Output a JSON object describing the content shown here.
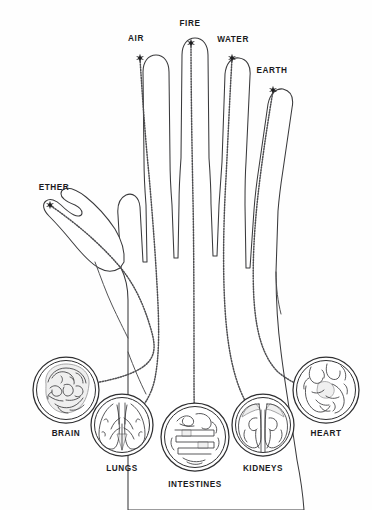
{
  "figure": {
    "background_color": "#fefefe",
    "stroke_color": "#3a3a3c",
    "meridian_color": "#4d4d50",
    "label_color": "#1b1b1d"
  },
  "elements": [
    {
      "id": "air",
      "label": "AIR",
      "digit": "index-finger",
      "label_x": 136,
      "label_y": 39,
      "tip_x": 140,
      "tip_y": 58
    },
    {
      "id": "fire",
      "label": "FIRE",
      "digit": "middle-finger",
      "label_x": 190,
      "label_y": 24,
      "tip_x": 191,
      "tip_y": 43
    },
    {
      "id": "water",
      "label": "WATER",
      "digit": "ring-finger",
      "label_x": 233,
      "label_y": 40,
      "tip_x": 232,
      "tip_y": 58
    },
    {
      "id": "earth",
      "label": "EARTH",
      "digit": "little-finger",
      "label_x": 272,
      "label_y": 71,
      "tip_x": 273,
      "tip_y": 90
    },
    {
      "id": "ether",
      "label": "ETHER",
      "digit": "thumb",
      "label_x": 54,
      "label_y": 188,
      "tip_x": 50,
      "tip_y": 205
    }
  ],
  "organs": [
    {
      "id": "brain",
      "label": "BRAIN",
      "cx": 66,
      "cy": 390,
      "r": 33,
      "label_x": 66,
      "label_y": 434
    },
    {
      "id": "lungs",
      "label": "LUNGS",
      "cx": 122,
      "cy": 425,
      "r": 31,
      "label_x": 122,
      "label_y": 469
    },
    {
      "id": "intestines",
      "label": "INTESTINES",
      "cx": 195,
      "cy": 437,
      "r": 34,
      "label_x": 195,
      "label_y": 485
    },
    {
      "id": "kidneys",
      "label": "KIDNEYS",
      "cx": 263,
      "cy": 425,
      "r": 31,
      "label_x": 263,
      "label_y": 469
    },
    {
      "id": "heart",
      "label": "HEART",
      "cx": 326,
      "cy": 390,
      "r": 33,
      "label_x": 326,
      "label_y": 434
    }
  ],
  "connections": [
    {
      "from": "ether",
      "to": "brain",
      "note": "thumb to brain"
    },
    {
      "from": "air",
      "to": "lungs",
      "note": "index finger to lungs"
    },
    {
      "from": "fire",
      "to": "intestines",
      "note": "middle finger to intestines"
    },
    {
      "from": "water",
      "to": "kidneys",
      "note": "ring finger to kidneys"
    },
    {
      "from": "earth",
      "to": "heart",
      "note": "little finger to heart"
    }
  ]
}
